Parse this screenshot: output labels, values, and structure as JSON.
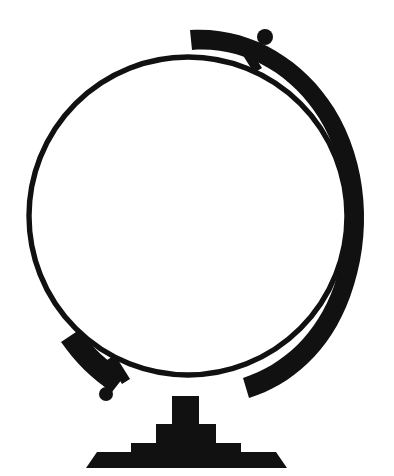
{
  "artwork": {
    "title": "Globe Silhouette",
    "subject": "desk globe on stand",
    "style": "solid black silhouette line art",
    "canvas": {
      "width": 394,
      "height": 476,
      "background_color": "#ffffff",
      "ink_color": "#111111"
    }
  },
  "icon_names": {
    "artwork": "globe-silhouette-artwork",
    "sphere_ring": "globe-sphere-ring-icon",
    "meridian_band": "globe-meridian-band-icon",
    "top_axis_knob": "globe-top-axis-knob-icon",
    "bottom_axis_knob": "globe-bottom-axis-knob-icon",
    "top_axis_bar": "globe-top-axis-bar-icon",
    "bottom_axis_bar": "globe-bottom-axis-bar-icon",
    "stem": "globe-stand-stem-icon",
    "base": "globe-stand-base-icon"
  },
  "geometry": {
    "sphere_ring": {
      "center_x": 188,
      "center_y": 216,
      "radius": 159,
      "stroke_width": 5,
      "color": "#111111"
    },
    "meridian_band": {
      "center_x": 188,
      "center_y": 216,
      "radius": 177,
      "stroke_width": 21,
      "color": "#111111",
      "arc_start_degrees": -118,
      "arc_end_degrees": 129,
      "tilt_degrees": 23
    },
    "top_axis_knob": {
      "center_x": 265,
      "center_y": 37,
      "radius": 8,
      "color": "#111111"
    },
    "bottom_axis_knob": {
      "center_x": 106,
      "center_y": 394,
      "radius": 7,
      "color": "#111111"
    },
    "stand": {
      "stem_x": 172,
      "stem_width": 27,
      "stem_top_y": 396,
      "stem_bottom_y": 424,
      "tier2_x": 156,
      "tier2_width": 60,
      "tier2_top_y": 424,
      "tier2_bottom_y": 443,
      "tier3_x": 131,
      "tier3_width": 110,
      "tier3_top_y": 443,
      "tier3_bottom_y": 452,
      "base_top_left_x": 97,
      "base_top_right_x": 276,
      "base_bottom_left_x": 86,
      "base_bottom_right_x": 287,
      "base_top_y": 452,
      "base_bottom_y": 468
    }
  }
}
